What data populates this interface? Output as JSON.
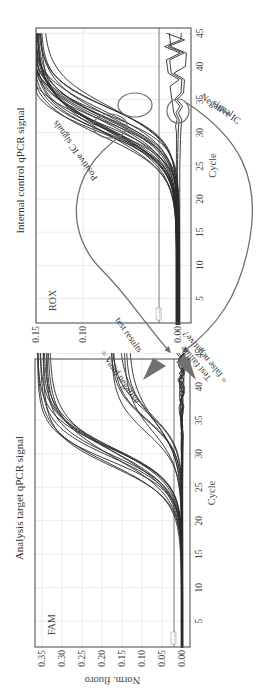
{
  "figure": {
    "rotation_deg": -90,
    "arrow_color": "#707070",
    "curve_color": "#2a2a2a",
    "grid_color": "#e6e6e6",
    "frame_color": "#555555"
  },
  "annotations": {
    "positive_ic": "Positive IC signals",
    "negative_ic_line1": "Negative IC",
    "negative_ic_line2": "signal",
    "valid_negative_line1": "= Valid negative",
    "valid_negative_line2": "test results",
    "test_failure_line1": "Test failure",
    "test_failure_line2": "= false negative?"
  },
  "chart_data": [
    {
      "type": "line",
      "title": "Analysis target qPCR signal",
      "channel": "FAM",
      "xlabel": "Cycle",
      "ylabel": "Norm. fluoro",
      "xlim": [
        1,
        45
      ],
      "ylim": [
        -0.01,
        0.35
      ],
      "xticks": [
        5,
        10,
        15,
        20,
        25,
        30,
        35,
        40,
        45
      ],
      "yticks": [
        "0.00",
        "0.05",
        "0.10",
        "0.15",
        "0.20",
        "0.25",
        "0.30",
        "0.35"
      ],
      "threshold": 0.02,
      "threshold_label": "Threshold",
      "grid": true,
      "legend": null,
      "series_description": "Sigmoid amplification curves; two groups of positives plus flat negatives",
      "series": [
        {
          "name": "early-positives",
          "count": 12,
          "ct_range": [
            28,
            31
          ],
          "plateau_range": [
            0.3,
            0.34
          ]
        },
        {
          "name": "late-positives",
          "count": 8,
          "ct_range": [
            33,
            37
          ],
          "plateau_range": [
            0.12,
            0.17
          ]
        },
        {
          "name": "negatives",
          "count": 8,
          "ct": null,
          "plateau_range": [
            0.0,
            0.01
          ]
        }
      ]
    },
    {
      "type": "line",
      "title": "Internal control qPCR signal",
      "channel": "ROX",
      "xlabel": "Cycle",
      "ylabel": "",
      "xlim": [
        1,
        45
      ],
      "ylim": [
        -0.01,
        0.15
      ],
      "xticks": [
        5,
        10,
        15,
        20,
        25,
        30,
        35,
        40,
        45
      ],
      "yticks": [
        "0.00",
        "0.10",
        "0.15"
      ],
      "threshold": 0.02,
      "threshold_label": "Threshold",
      "grid": true,
      "legend": null,
      "series_description": "Positive IC curves with Ct ~30-34; a few flat negative IC curves",
      "series": [
        {
          "name": "positive-IC",
          "count": 24,
          "ct_range": [
            29,
            34
          ],
          "plateau_range": [
            0.13,
            0.15
          ]
        },
        {
          "name": "negative-IC",
          "count": 3,
          "ct": null,
          "plateau_range": [
            0.0,
            0.015
          ]
        }
      ]
    }
  ]
}
